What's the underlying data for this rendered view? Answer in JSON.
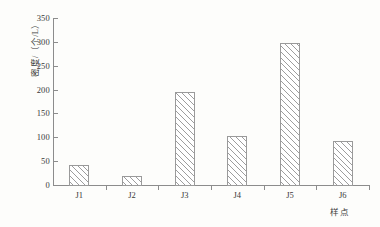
{
  "chart_data": {
    "type": "bar",
    "title": "",
    "subtitle": "",
    "xlabel": "样点",
    "ylabel": "密度/（个/L）",
    "categories": [
      "J1",
      "J2",
      "J3",
      "J4",
      "J5",
      "J6"
    ],
    "values": [
      43,
      20,
      198,
      105,
      300,
      95
    ],
    "ylim": [
      0,
      350
    ],
    "ytick_step": 50,
    "ytick_labels": [
      "0",
      "50",
      "100",
      "150",
      "200",
      "250",
      "300",
      "350"
    ],
    "ytick_values": [
      0,
      50,
      100,
      150,
      200,
      250,
      300,
      350
    ],
    "grid": false,
    "legend": null,
    "legend_position": "none",
    "series": [
      {
        "name": "密度",
        "values": [
          43,
          20,
          198,
          105,
          300,
          95
        ]
      }
    ],
    "annotations": [],
    "style": {
      "bar_fill": "#ffffff",
      "bar_hatch": "diagonal-45",
      "bar_edge_color": "#9a9a9a",
      "hatch_color": "#9d9d9d",
      "axis_color": "#8c8c8c",
      "text_color": "#3a3a3a",
      "background": "#fdfdfb"
    }
  }
}
